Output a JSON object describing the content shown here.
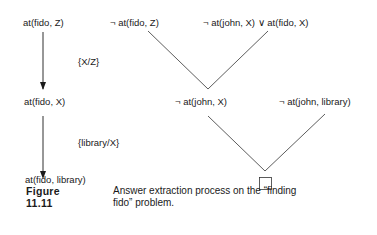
{
  "left_chain": {
    "n1": "at(fido, Z)",
    "sub1": "{X/Z}",
    "n2": "at(fido, X)",
    "sub2": "{library/X}",
    "n3": "at(fido, library)"
  },
  "resolution_tree": {
    "top_left": "¬ at(fido, Z)",
    "top_right": "¬ at(john, X) ∨ at(fido, X)",
    "mid_left": "¬ at(john, X)",
    "mid_right": "¬ at(john, library)",
    "result": "empty-clause"
  },
  "caption": {
    "label": "Figure 11.11",
    "text": "Answer extraction process on the “finding fido” problem."
  }
}
